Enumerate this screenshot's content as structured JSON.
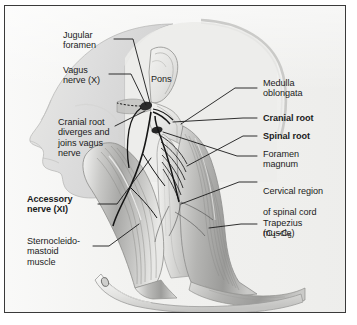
{
  "figure": {
    "background_color": "#f2f2f0",
    "frame_color": "#3a3a3a",
    "text_color": "#1b1b1b",
    "leader_line_color": "#1a1a1a"
  },
  "labels": {
    "jugular_foramen": "Jugular\nforamen",
    "vagus_nerve": "Vagus\nnerve (X)",
    "cranial_root_diverges": "Cranial root\ndiverges and\njoins vagus\nnerve",
    "accessory_nerve": "Accessory\nnerve (XI)",
    "sternocleidomastoid": "Sternocleido-\nmastoid\nmuscle",
    "pons": "Pons",
    "medulla_oblongata": "Medulla\noblongata",
    "cranial_root": "Cranial root",
    "spinal_root": "Spinal root",
    "foramen_magnum": "Foramen\nmagnum",
    "cervical_region_line1": "Cervical region",
    "cervical_region_line2": "of spinal cord",
    "cervical_region_line3_prefix": "(C",
    "cervical_region_sub1": "1",
    "cervical_region_dash": "–C",
    "cervical_region_sub2": "5",
    "cervical_region_line3_suffix": ")",
    "trapezius": "Trapezius\nmuscle"
  },
  "anatomy_structures": [
    {
      "name": "head-profile",
      "label": "Lateral head and face profile"
    },
    {
      "name": "pons",
      "label": "Pons"
    },
    {
      "name": "medulla-oblongata",
      "label": "Medulla oblongata"
    },
    {
      "name": "cranial-root",
      "label": "Cranial root of accessory nerve"
    },
    {
      "name": "spinal-root",
      "label": "Spinal root of accessory nerve"
    },
    {
      "name": "jugular-foramen",
      "label": "Jugular foramen"
    },
    {
      "name": "foramen-magnum",
      "label": "Foramen magnum"
    },
    {
      "name": "vagus-nerve",
      "label": "Vagus nerve (X)"
    },
    {
      "name": "accessory-nerve",
      "label": "Accessory nerve (XI)"
    },
    {
      "name": "cervical-spinal-cord",
      "label": "Cervical region of spinal cord (C1-C5)"
    },
    {
      "name": "sternocleidomastoid-muscle",
      "label": "Sternocleidomastoid muscle"
    },
    {
      "name": "trapezius-muscle",
      "label": "Trapezius muscle"
    },
    {
      "name": "clavicle",
      "label": "Clavicle"
    }
  ]
}
